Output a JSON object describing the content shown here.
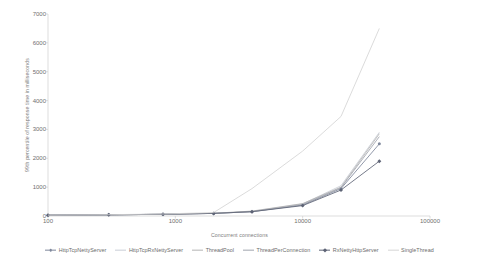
{
  "chart_data": {
    "type": "line",
    "title": "",
    "xlabel": "Concurrent connections",
    "ylabel": "99th percentile of response time in milliseconds",
    "xscale": "log",
    "xlim": [
      100,
      100000
    ],
    "ylim": [
      0,
      7000
    ],
    "xticks": [
      100,
      1000,
      10000,
      100000
    ],
    "xtick_labels": [
      "100",
      "1000",
      "10000",
      "100000"
    ],
    "yticks": [
      0,
      1000,
      2000,
      3000,
      4000,
      5000,
      6000,
      7000
    ],
    "ytick_labels": [
      "0",
      "1000",
      "2000",
      "3000",
      "4000",
      "5000",
      "6000",
      "7000"
    ],
    "grid": false,
    "legend_position": "bottom",
    "x": [
      100,
      300,
      800,
      2000,
      4000,
      10000,
      20000,
      40000
    ],
    "series": [
      {
        "name": "HttpTcpNettyServer",
        "color": "#7e879b",
        "marker": "circle",
        "values": [
          30,
          40,
          60,
          90,
          150,
          380,
          950,
          2500
        ]
      },
      {
        "name": "HttpTcpRxNettyServer",
        "color": "#c9cdd6",
        "marker": "none",
        "values": [
          30,
          40,
          60,
          90,
          160,
          420,
          1050,
          2900
        ]
      },
      {
        "name": "ThreadPool",
        "color": "#b4b4b4",
        "marker": "none",
        "values": [
          30,
          40,
          60,
          95,
          170,
          430,
          1000,
          2850
        ]
      },
      {
        "name": "ThreadPerConnection",
        "color": "#a0a4ad",
        "marker": "none",
        "values": [
          30,
          40,
          60,
          90,
          150,
          400,
          980,
          2750
        ]
      },
      {
        "name": "RxNettyHttpServer",
        "color": "#5d6375",
        "marker": "diamond",
        "values": [
          30,
          40,
          60,
          90,
          150,
          360,
          900,
          1900
        ]
      },
      {
        "name": "SingleThread",
        "color": "#d5d5d5",
        "marker": "none",
        "values": [
          30,
          45,
          70,
          120,
          950,
          2250,
          3450,
          6500
        ]
      }
    ]
  },
  "legend": {
    "items": [
      {
        "label": "HttpTcpNettyServer"
      },
      {
        "label": "HttpTcpRxNettyServer"
      },
      {
        "label": "ThreadPool"
      },
      {
        "label": "ThreadPerConnection"
      },
      {
        "label": "RxNettyHttpServer"
      },
      {
        "label": "SingleThread"
      }
    ]
  }
}
